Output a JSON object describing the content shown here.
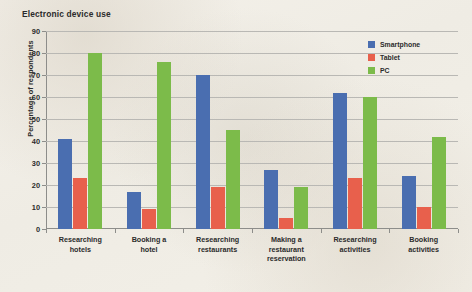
{
  "chart_data": {
    "type": "bar",
    "title": "Electronic device use",
    "xlabel": "",
    "ylabel": "Percentage of respondents",
    "ylim": [
      0,
      90
    ],
    "ytick_step": 10,
    "yticks": [
      0,
      10,
      20,
      30,
      40,
      50,
      60,
      70,
      80,
      90
    ],
    "grid": true,
    "legend_position": "top-right",
    "categories": [
      "Researching hotels",
      "Booking a hotel",
      "Researching restaurants",
      "Making a restaurant reservation",
      "Researching activities",
      "Booking activities"
    ],
    "category_lines": [
      [
        "Researching",
        "hotels"
      ],
      [
        "Booking a",
        "hotel"
      ],
      [
        "Researching",
        "restaurants"
      ],
      [
        "Making a",
        "restaurant",
        "reservation"
      ],
      [
        "Researching",
        "activities"
      ],
      [
        "Booking",
        "activities"
      ]
    ],
    "series": [
      {
        "name": "Smartphone",
        "color": "#4a6eb0",
        "values": [
          41,
          17,
          70,
          27,
          62,
          24
        ]
      },
      {
        "name": "Tablet",
        "color": "#e8604c",
        "values": [
          23,
          9,
          19,
          5,
          23,
          10
        ]
      },
      {
        "name": "PC",
        "color": "#7cbb4a",
        "values": [
          80,
          76,
          45,
          19,
          60,
          42
        ]
      }
    ]
  },
  "legend": {
    "items": [
      {
        "label": "Smartphone",
        "color": "#4a6eb0"
      },
      {
        "label": "Tablet",
        "color": "#e8604c"
      },
      {
        "label": "PC",
        "color": "#7cbb4a"
      }
    ]
  }
}
